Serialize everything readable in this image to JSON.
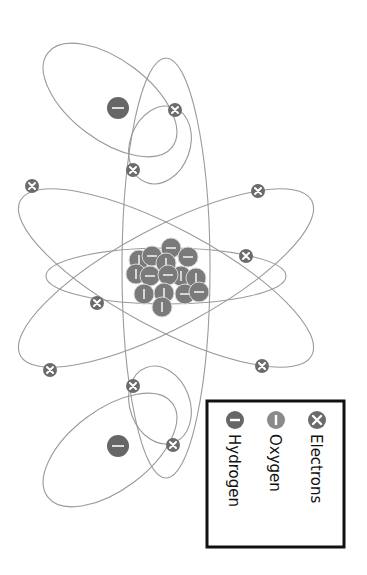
{
  "diagram": {
    "orientation": "rotated 90deg clockwise",
    "colors": {
      "orbit": "#9a9a9a",
      "electron": "#6b6b6b",
      "oxygen": "#8a8a8a",
      "hydrogen": "#666666",
      "legend_border": "#111111"
    },
    "legend": {
      "items": [
        {
          "label": "Electrons",
          "icon": "x-circle-icon"
        },
        {
          "label": "Oxygen",
          "icon": "vertical-bar-circle-icon"
        },
        {
          "label": "Hydrogen",
          "icon": "minus-circle-icon"
        }
      ]
    },
    "counts": {
      "electrons": 10,
      "hydrogen_nuclei": 2
    }
  }
}
